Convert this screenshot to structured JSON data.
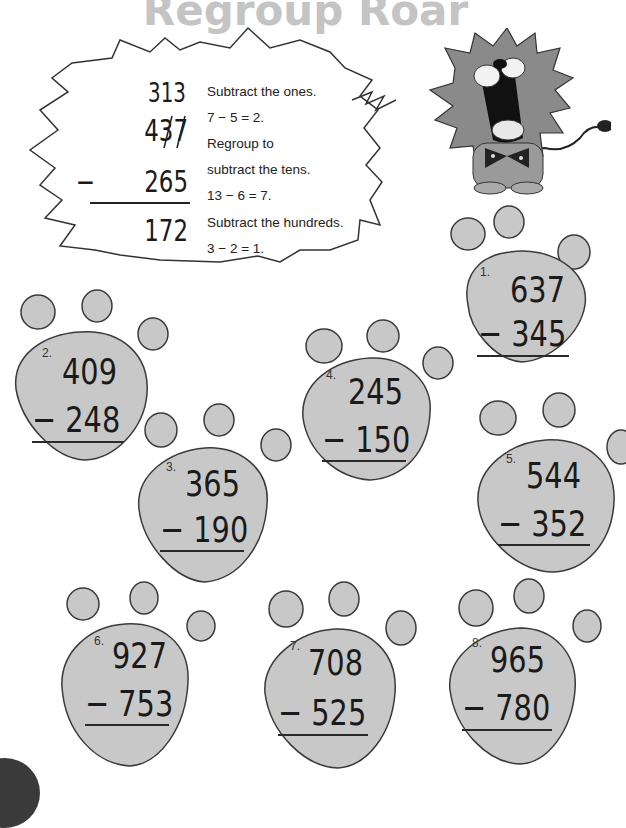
{
  "title": "Regroup Roar",
  "example": {
    "regroup_marks": "313",
    "top": "437",
    "bottom": "265",
    "operator": "−",
    "answer": "172",
    "steps": [
      "Subtract the ones.",
      "7 − 5 = 2.",
      "Regroup to",
      "subtract the tens.",
      "13 − 6 = 7.",
      "Subtract the hundreds.",
      "3 − 2 = 1."
    ]
  },
  "problems": [
    {
      "label": "1.",
      "top": "637",
      "bottom": "− 345"
    },
    {
      "label": "2.",
      "top": "409",
      "bottom": "− 248"
    },
    {
      "label": "3.",
      "top": "365",
      "bottom": "− 190"
    },
    {
      "label": "4.",
      "top": "245",
      "bottom": "− 150"
    },
    {
      "label": "5.",
      "top": "544",
      "bottom": "− 352"
    },
    {
      "label": "6.",
      "top": "927",
      "bottom": "− 753"
    },
    {
      "label": "7.",
      "top": "708",
      "bottom": "− 525"
    },
    {
      "label": "8.",
      "top": "965",
      "bottom": "− 780"
    }
  ],
  "colors": {
    "paw_fill": "#c8c8c8",
    "paw_stroke": "#3a3a3a",
    "title": "#c4c4c4"
  }
}
